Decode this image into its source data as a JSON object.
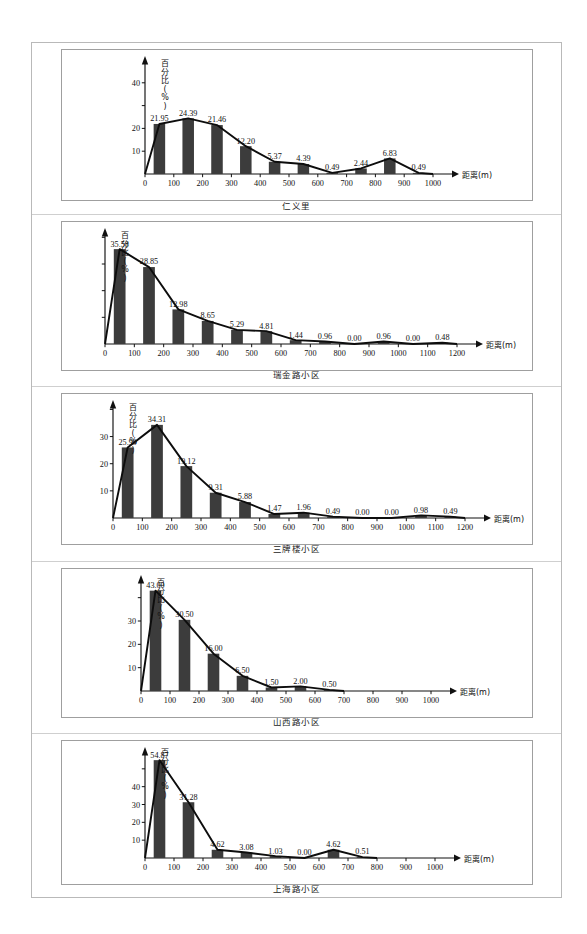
{
  "page": {
    "y_axis_label": "百分比(%)",
    "x_axis_label": "距离(m)"
  },
  "chart_data": [
    {
      "type": "bar",
      "title": "仁义里",
      "xlabel": "距离(m)",
      "ylabel": "百分比(%)",
      "categories": [
        "0-100",
        "100-200",
        "200-300",
        "300-400",
        "400-500",
        "500-600",
        "600-700",
        "700-800",
        "800-900",
        "900-1000"
      ],
      "x_ticks": [
        "0",
        "100",
        "200",
        "300",
        "400",
        "500",
        "600",
        "700",
        "800",
        "900",
        "1000"
      ],
      "y_ticks": [
        "10",
        "20",
        "40"
      ],
      "y_tick_values": [
        10,
        20,
        40
      ],
      "ylim": [
        0,
        50
      ],
      "xlim": [
        0,
        1000
      ],
      "values": [
        21.95,
        24.39,
        21.46,
        12.2,
        5.37,
        4.39,
        0.49,
        2.44,
        6.83,
        0.49
      ],
      "labels": [
        "21.95",
        "24.39",
        "21.46",
        "12.20",
        "5.37",
        "4.39",
        "0.49",
        "2.44",
        "6.83",
        "0.49"
      ],
      "grid": false,
      "legend": "none"
    },
    {
      "type": "bar",
      "title": "瑞金路小区",
      "xlabel": "距离(m)",
      "ylabel": "百分比(%)",
      "categories": [
        "0-100",
        "100-200",
        "200-300",
        "300-400",
        "400-500",
        "500-600",
        "600-700",
        "700-800",
        "800-900",
        "900-1000",
        "1000-1100",
        "1100-1200"
      ],
      "x_ticks": [
        "0",
        "100",
        "200",
        "300",
        "400",
        "500",
        "600",
        "700",
        "800",
        "900",
        "1000",
        "1100",
        "1200"
      ],
      "y_ticks": [],
      "y_tick_values": [],
      "ylim": [
        0,
        42
      ],
      "xlim": [
        0,
        1200
      ],
      "values": [
        35.58,
        28.85,
        12.98,
        8.65,
        5.29,
        4.81,
        1.44,
        0.96,
        0.0,
        0.96,
        0.0,
        0.48
      ],
      "labels": [
        "35.58",
        "28.85",
        "12.98",
        "8.65",
        "5.29",
        "4.81",
        "1.44",
        "0.96",
        "0.00",
        "0.96",
        "0.00",
        "0.48"
      ],
      "grid": false,
      "legend": "none"
    },
    {
      "type": "bar",
      "title": "三牌楼小区",
      "xlabel": "距离(m)",
      "ylabel": "百分比(%)",
      "categories": [
        "0-100",
        "100-200",
        "200-300",
        "300-400",
        "400-500",
        "500-600",
        "600-700",
        "700-800",
        "800-900",
        "900-1000",
        "1000-1100",
        "1100-1200"
      ],
      "x_ticks": [
        "0",
        "100",
        "200",
        "300",
        "400",
        "500",
        "600",
        "700",
        "800",
        "900",
        "1000",
        "1100",
        "1200"
      ],
      "y_ticks": [
        "10",
        "20",
        "30"
      ],
      "y_tick_values": [
        10,
        20,
        30
      ],
      "ylim": [
        0,
        42
      ],
      "xlim": [
        0,
        1200
      ],
      "values": [
        25.99,
        34.31,
        19.12,
        9.31,
        5.88,
        1.47,
        1.96,
        0.49,
        0.0,
        0.0,
        0.98,
        0.49
      ],
      "labels": [
        "25.99",
        "34.31",
        "19.12",
        "9.31",
        "5.88",
        "1.47",
        "1.96",
        "0.49",
        "0.00",
        "0.00",
        "0.98",
        "0.49"
      ],
      "grid": false,
      "legend": "none"
    },
    {
      "type": "bar",
      "title": "山西路小区",
      "xlabel": "距离(m)",
      "ylabel": "百分比(%)",
      "categories": [
        "0-100",
        "100-200",
        "200-300",
        "300-400",
        "400-500",
        "500-600",
        "600-700"
      ],
      "x_ticks": [
        "0",
        "100",
        "200",
        "300",
        "400",
        "500",
        "600",
        "700",
        "800",
        "900",
        "1000"
      ],
      "y_ticks": [
        "10",
        "20",
        "30"
      ],
      "y_tick_values": [
        10,
        20,
        30
      ],
      "ylim": [
        0,
        48
      ],
      "xlim": [
        0,
        1000
      ],
      "values": [
        43.0,
        30.5,
        16.0,
        6.5,
        1.5,
        2.0,
        0.5
      ],
      "labels": [
        "43.00",
        "30.50",
        "16.00",
        "6.50",
        "1.50",
        "2.00",
        "0.50"
      ],
      "grid": false,
      "legend": "none"
    },
    {
      "type": "bar",
      "title": "上海路小区",
      "xlabel": "距离(m)",
      "ylabel": "百分比(%)",
      "categories": [
        "0-100",
        "100-200",
        "200-300",
        "300-400",
        "400-500",
        "500-600",
        "600-700",
        "700-800"
      ],
      "x_ticks": [
        "0",
        "100",
        "200",
        "300",
        "400",
        "500",
        "600",
        "700",
        "800",
        "900",
        "1000"
      ],
      "y_ticks": [
        "10",
        "20",
        "30",
        "40"
      ],
      "y_tick_values": [
        10,
        20,
        30,
        40
      ],
      "ylim": [
        0,
        60
      ],
      "xlim": [
        0,
        1000
      ],
      "values": [
        54.87,
        31.28,
        4.62,
        3.08,
        1.03,
        0.0,
        4.62,
        0.51
      ],
      "labels": [
        "54.87",
        "31.28",
        "4.62",
        "3.08",
        "1.03",
        "0.00",
        "4.62",
        "0.51"
      ],
      "grid": false,
      "legend": "none"
    }
  ]
}
